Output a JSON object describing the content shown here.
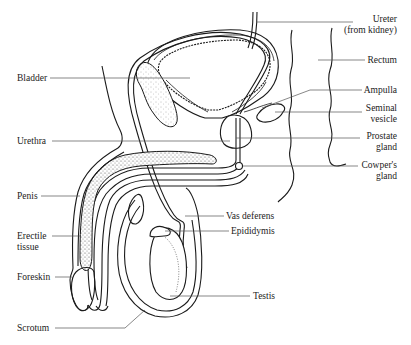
{
  "diagram": {
    "labels_left": {
      "bladder": "Bladder",
      "urethra": "Urethra",
      "penis": "Penis",
      "erectile_tissue_1": "Erectile",
      "erectile_tissue_2": "tissue",
      "foreskin": "Foreskin",
      "scrotum": "Scrotum"
    },
    "labels_right": {
      "ureter_1": "Ureter",
      "ureter_2": "(from kidney)",
      "rectum": "Rectum",
      "ampulla": "Ampulla",
      "seminal_vesicle_1": "Seminal",
      "seminal_vesicle_2": "vesicle",
      "prostate_1": "Prostate",
      "prostate_2": "gland",
      "cowpers_1": "Cowper's",
      "cowpers_2": "gland",
      "vas_deferens": "Vas deferens",
      "epididymis": "Epididymis",
      "testis": "Testis"
    },
    "colors": {
      "line": "#1a1a1a",
      "leader": "#555555",
      "text": "#222222",
      "stipple": "#666666"
    }
  }
}
